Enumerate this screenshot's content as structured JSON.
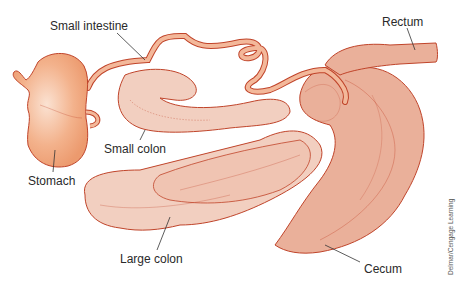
{
  "diagram": {
    "labels": {
      "small_intestine": "Small intestine",
      "rectum": "Rectum",
      "small_colon": "Small colon",
      "stomach": "Stomach",
      "large_colon": "Large colon",
      "cecum": "Cecum"
    },
    "credit": "Delmar/Cengage Learning",
    "colors": {
      "stomach_fill": "#f0a27a",
      "intestine_fill": "#f3b89a",
      "colon_fill": "#f2cfc0",
      "cecum_fill": "#eab09a",
      "outline": "#c0442a",
      "leader_line": "#333333",
      "text": "#2a2a2a"
    }
  }
}
